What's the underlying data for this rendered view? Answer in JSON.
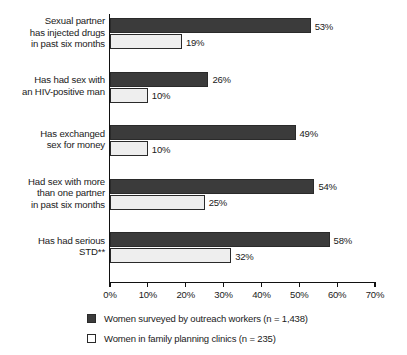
{
  "chart_data": {
    "type": "bar",
    "orientation": "horizontal",
    "title": "",
    "subtitle": "",
    "xlabel": "",
    "ylabel": "",
    "xlim": [
      0,
      70
    ],
    "grid": false,
    "legend_position": "bottom",
    "tick_labels": [
      "0%",
      "10%",
      "20%",
      "30%",
      "40%",
      "50%",
      "60%",
      "70%"
    ],
    "tick_values": [
      0,
      10,
      20,
      30,
      40,
      50,
      60,
      70
    ],
    "categories": [
      "Sexual partner\nhas injected drugs\nin past six months",
      "Has had sex with\nan HIV-positive man",
      "Has exchanged\nsex for money",
      "Had sex with more\nthan one partner\nin past six months",
      "Has had serious\nSTD**"
    ],
    "series": [
      {
        "name": "Women surveyed by outreach workers (n = 1,438)",
        "color": "#3b3b3b",
        "values": [
          53,
          26,
          49,
          54,
          58
        ],
        "labels": [
          "53%",
          "26%",
          "49%",
          "54%",
          "58%"
        ]
      },
      {
        "name": "Women in family planning clinics (n = 235)",
        "color": "#eeeeee",
        "values": [
          19,
          10,
          10,
          25,
          32
        ],
        "labels": [
          "19%",
          "10%",
          "10%",
          "25%",
          "32%"
        ]
      }
    ]
  },
  "legend": {
    "items": [
      {
        "label": "Women surveyed by outreach workers (n = 1,438)",
        "swatch": "dark"
      },
      {
        "label": "Women in family planning clinics (n = 235)",
        "swatch": "light"
      }
    ]
  }
}
